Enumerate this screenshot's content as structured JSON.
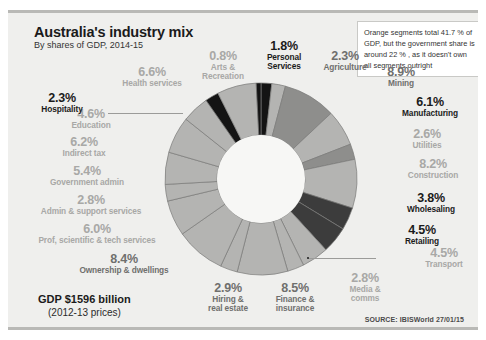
{
  "header": {
    "title": "Australia's industry mix",
    "subtitle": "By shares of GDP, 2014-15"
  },
  "footer": {
    "gdp_total": "GDP $1596 billion",
    "gdp_basis": "(2012-13 prices)",
    "source": "SOURCE: IBISWorld 27/01/15"
  },
  "annotation": {
    "text": "Orange segments total 41.7 % of GDP, but the government share is around 22 % , as it doesn't own all segments outright"
  },
  "colors": {
    "card_background": "#efefed",
    "card_border": "#b9b9b6",
    "segment_light": "#b4b4b2",
    "segment_mid": "#8e8e8c",
    "segment_dark": "#3c3c3c",
    "segment_black": "#141414",
    "segment_outline": "#7a7a78",
    "label_grey": "#a8a8a6",
    "label_mid": "#6f6f6d",
    "label_dark": "#1b1b1b",
    "note_background": "#ffffff"
  },
  "chart_data": {
    "type": "pie",
    "title": "Australia's industry mix",
    "subtitle": "By shares of GDP, 2014-15",
    "unit": "% of GDP",
    "total_label": "GDP $1596 billion",
    "categories": [
      "Personal Services",
      "Agriculture",
      "Mining",
      "Manufacturing",
      "Utilities",
      "Construction",
      "Wholesaling",
      "Retailing",
      "Transport",
      "Media & comms",
      "Finance & insurance",
      "Hiring & real estate",
      "Ownership & dwellings",
      "Prof, scientific & tech services",
      "Admin & support services",
      "Government admin",
      "Indirect tax",
      "Education",
      "Hospitality",
      "Health services",
      "Arts & Recreation"
    ],
    "values": [
      1.8,
      2.3,
      8.9,
      6.1,
      2.6,
      8.2,
      3.8,
      4.5,
      4.5,
      2.8,
      8.5,
      2.9,
      8.4,
      6.0,
      2.8,
      5.4,
      6.2,
      4.6,
      2.3,
      6.6,
      0.8
    ],
    "segments": [
      {
        "label": "Personal Services",
        "value": 1.8,
        "display": "1.8%",
        "shade": "black",
        "emphasis": "dark"
      },
      {
        "label": "Agriculture",
        "value": 2.3,
        "display": "2.3%",
        "shade": "light",
        "emphasis": "mid"
      },
      {
        "label": "Mining",
        "value": 8.9,
        "display": "8.9%",
        "shade": "mid",
        "emphasis": "mid"
      },
      {
        "label": "Manufacturing",
        "value": 6.1,
        "display": "6.1%",
        "shade": "light",
        "emphasis": "dark"
      },
      {
        "label": "Utilities",
        "value": 2.6,
        "display": "2.6%",
        "shade": "mid",
        "emphasis": "grey"
      },
      {
        "label": "Construction",
        "value": 8.2,
        "display": "8.2%",
        "shade": "light",
        "emphasis": "grey"
      },
      {
        "label": "Wholesaling",
        "value": 3.8,
        "display": "3.8%",
        "shade": "dark",
        "emphasis": "dark"
      },
      {
        "label": "Retailing",
        "value": 4.5,
        "display": "4.5%",
        "shade": "dark",
        "emphasis": "dark"
      },
      {
        "label": "Transport",
        "value": 4.5,
        "display": "4.5%",
        "shade": "light",
        "emphasis": "grey"
      },
      {
        "label": "Media & comms",
        "value": 2.8,
        "display": "2.8%",
        "shade": "light",
        "emphasis": "grey"
      },
      {
        "label": "Finance & insurance",
        "value": 8.5,
        "display": "8.5%",
        "shade": "light",
        "emphasis": "mid"
      },
      {
        "label": "Hiring & real estate",
        "value": 2.9,
        "display": "2.9%",
        "shade": "light",
        "emphasis": "mid"
      },
      {
        "label": "Ownership & dwellings",
        "value": 8.4,
        "display": "8.4%",
        "shade": "light",
        "emphasis": "mid"
      },
      {
        "label": "Prof, scientific & tech services",
        "value": 6.0,
        "display": "6.0%",
        "shade": "light",
        "emphasis": "grey"
      },
      {
        "label": "Admin & support services",
        "value": 2.8,
        "display": "2.8%",
        "shade": "light",
        "emphasis": "grey"
      },
      {
        "label": "Government admin",
        "value": 5.4,
        "display": "5.4%",
        "shade": "light",
        "emphasis": "grey"
      },
      {
        "label": "Indirect tax",
        "value": 6.2,
        "display": "6.2%",
        "shade": "light",
        "emphasis": "grey"
      },
      {
        "label": "Education",
        "value": 4.6,
        "display": "4.6%",
        "shade": "light",
        "emphasis": "grey"
      },
      {
        "label": "Hospitality",
        "value": 2.3,
        "display": "2.3%",
        "shade": "black",
        "emphasis": "dark"
      },
      {
        "label": "Health services",
        "value": 6.6,
        "display": "6.6%",
        "shade": "light",
        "emphasis": "grey"
      },
      {
        "label": "Arts & Recreation",
        "value": 0.8,
        "display": "0.8%",
        "shade": "black",
        "emphasis": "grey"
      }
    ]
  },
  "labels": {
    "arts": {
      "pct": "0.8%",
      "l1": "Arts &",
      "l2": "Recreation"
    },
    "personal": {
      "pct": "1.8%",
      "l1": "Personal",
      "l2": "Services"
    },
    "agriculture": {
      "pct": "2.3%",
      "l1": "Agriculture",
      "l2": ""
    },
    "mining": {
      "pct": "8.9%",
      "l1": "Mining",
      "l2": ""
    },
    "manufacturing": {
      "pct": "6.1%",
      "l1": "Manufacturing",
      "l2": ""
    },
    "utilities": {
      "pct": "2.6%",
      "l1": "Utilities",
      "l2": ""
    },
    "construction": {
      "pct": "8.2%",
      "l1": "Construction",
      "l2": ""
    },
    "wholesaling": {
      "pct": "3.8%",
      "l1": "Wholesaling",
      "l2": ""
    },
    "retailing": {
      "pct": "4.5%",
      "l1": "Retailing",
      "l2": ""
    },
    "transport": {
      "pct": "4.5%",
      "l1": "Transport",
      "l2": ""
    },
    "media": {
      "pct": "2.8%",
      "l1": "Media &",
      "l2": "comms"
    },
    "finance": {
      "pct": "8.5%",
      "l1": "Finance &",
      "l2": "insurance"
    },
    "hiring": {
      "pct": "2.9%",
      "l1": "Hiring &",
      "l2": "real estate"
    },
    "ownership": {
      "pct": "8.4%",
      "l1": "Ownership & dwellings",
      "l2": ""
    },
    "prof": {
      "pct": "6.0%",
      "l1": "Prof, scientific & tech services",
      "l2": ""
    },
    "admin": {
      "pct": "2.8%",
      "l1": "Admin & support services",
      "l2": ""
    },
    "govadmin": {
      "pct": "5.4%",
      "l1": "Government admin",
      "l2": ""
    },
    "indirecttax": {
      "pct": "6.2%",
      "l1": "Indirect tax",
      "l2": ""
    },
    "education": {
      "pct": "4.6%",
      "l1": "Education",
      "l2": ""
    },
    "health": {
      "pct": "6.6%",
      "l1": "Health services",
      "l2": ""
    },
    "hospitality": {
      "pct": "2.3%",
      "l1": "Hospitality",
      "l2": ""
    }
  }
}
